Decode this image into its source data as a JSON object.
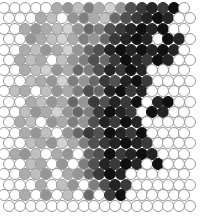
{
  "figure": {
    "name": "hexagonal-circle-lattice",
    "type": "grayscale-circle-packing",
    "width": 202,
    "height": 218,
    "background_color": "#ffffff",
    "circle": {
      "diameter": 12,
      "stroke_color": "#9a9a9a",
      "stroke_width": 1,
      "empty_fill": "#ffffff"
    },
    "lattice": {
      "packing": "hexagonal-staggered",
      "columns": 18,
      "rows": 20,
      "x_pitch": 10.6,
      "y_pitch": 10.4,
      "x_origin": 4,
      "y_origin": 8,
      "odd_row_offset": 5.3
    },
    "palette": {
      "0": "#ffffff",
      "1": "#f2f2f2",
      "2": "#e2e2e2",
      "3": "#d2d2d2",
      "4": "#c0c0c0",
      "5": "#ababab",
      "6": "#959595",
      "7": "#7e7e7e",
      "8": "#686868",
      "9": "#505050",
      "10": "#3a3a3a",
      "11": "#242424",
      "12": "#101010"
    }
  },
  "chart_data": {
    "type": "heatmap",
    "title": "",
    "xlabel": "",
    "ylabel": "",
    "legend": [],
    "grid": false,
    "marker": "circle",
    "layout": "hexagonal-staggered",
    "value_range": [
      0,
      12
    ],
    "colormap": "grayscale-inverted",
    "rows": 20,
    "cols": 18,
    "values": [
      [
        0,
        0,
        0,
        0,
        0,
        5,
        6,
        4,
        7,
        5,
        3,
        6,
        9,
        10,
        11,
        10,
        12,
        0
      ],
      [
        0,
        0,
        0,
        5,
        4,
        0,
        6,
        7,
        5,
        4,
        8,
        9,
        10,
        11,
        12,
        11,
        0,
        0
      ],
      [
        0,
        0,
        5,
        6,
        5,
        4,
        3,
        6,
        8,
        7,
        9,
        10,
        11,
        12,
        11,
        12,
        0,
        0
      ],
      [
        0,
        0,
        6,
        5,
        4,
        3,
        5,
        7,
        6,
        8,
        10,
        11,
        12,
        11,
        0,
        12,
        11,
        0
      ],
      [
        0,
        0,
        5,
        4,
        6,
        5,
        3,
        6,
        8,
        9,
        11,
        12,
        11,
        12,
        11,
        12,
        11,
        0
      ],
      [
        0,
        5,
        4,
        5,
        0,
        4,
        6,
        7,
        9,
        8,
        10,
        12,
        11,
        10,
        12,
        11,
        0,
        0
      ],
      [
        0,
        0,
        5,
        4,
        3,
        6,
        5,
        8,
        7,
        9,
        11,
        10,
        12,
        11,
        0,
        0,
        0,
        0
      ],
      [
        0,
        0,
        4,
        5,
        6,
        3,
        7,
        6,
        8,
        10,
        9,
        11,
        12,
        10,
        0,
        0,
        0,
        0
      ],
      [
        0,
        4,
        5,
        0,
        4,
        6,
        5,
        7,
        9,
        8,
        11,
        12,
        10,
        11,
        0,
        0,
        0,
        0
      ],
      [
        0,
        0,
        5,
        4,
        6,
        5,
        8,
        6,
        10,
        9,
        11,
        10,
        12,
        0,
        11,
        12,
        0,
        0
      ],
      [
        0,
        0,
        4,
        6,
        5,
        3,
        6,
        8,
        7,
        10,
        12,
        11,
        10,
        0,
        12,
        11,
        0,
        0
      ],
      [
        0,
        5,
        4,
        0,
        6,
        5,
        7,
        6,
        9,
        11,
        10,
        12,
        11,
        0,
        0,
        0,
        0,
        0
      ],
      [
        0,
        0,
        5,
        6,
        4,
        0,
        6,
        8,
        10,
        9,
        12,
        11,
        10,
        12,
        0,
        0,
        0,
        0
      ],
      [
        0,
        0,
        4,
        5,
        6,
        3,
        5,
        7,
        9,
        10,
        11,
        12,
        11,
        10,
        0,
        0,
        0,
        0
      ],
      [
        0,
        5,
        6,
        4,
        0,
        5,
        6,
        0,
        8,
        9,
        12,
        10,
        11,
        12,
        11,
        0,
        0,
        0
      ],
      [
        0,
        0,
        4,
        5,
        0,
        6,
        0,
        7,
        9,
        11,
        10,
        12,
        11,
        0,
        12,
        0,
        0,
        0
      ],
      [
        0,
        0,
        5,
        4,
        6,
        0,
        5,
        6,
        8,
        10,
        12,
        11,
        0,
        0,
        0,
        0,
        0,
        0
      ],
      [
        0,
        0,
        0,
        5,
        0,
        4,
        6,
        0,
        7,
        9,
        11,
        10,
        0,
        0,
        0,
        0,
        0,
        0
      ],
      [
        0,
        0,
        5,
        0,
        6,
        0,
        4,
        0,
        8,
        0,
        10,
        12,
        0,
        0,
        0,
        0,
        0,
        0
      ],
      [
        0,
        0,
        0,
        0,
        0,
        0,
        0,
        0,
        0,
        0,
        0,
        0,
        0,
        0,
        0,
        0,
        0,
        0
      ]
    ]
  }
}
